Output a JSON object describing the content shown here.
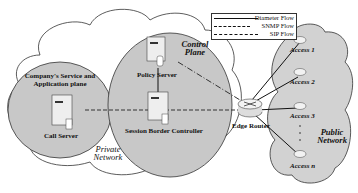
{
  "diagram": {
    "regions": {
      "private_network": "Private Network",
      "public_network": "Public Network",
      "company_plane": "Company's Service and Application plane",
      "control_plane": "Control Plane"
    },
    "nodes": {
      "call_server": "Call Server",
      "policy_server": "Policy Server",
      "sbc": "Session Border Controller",
      "edge_router": "Edge Router",
      "access_1": "Access 1",
      "access_2": "Access 2",
      "access_3": "Access 3",
      "access_n": "Access n"
    },
    "legend": {
      "diameter": "Diameter Flow",
      "snmp": "SNMP Flow",
      "sip": "SIP Flow"
    },
    "colors": {
      "plane_fill": "#c8c8c8",
      "cloud_stroke": "#333333",
      "public_fill": "#d2d2d2"
    }
  }
}
